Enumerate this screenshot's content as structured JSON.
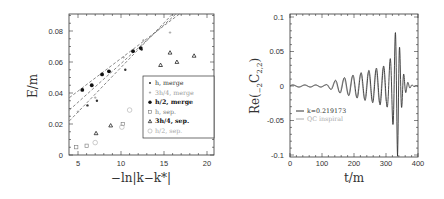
{
  "chart_data": [
    {
      "type": "scatter",
      "title": "",
      "xlabel": "-ln|k-k*|",
      "ylabel": "E/m",
      "xlim": [
        4,
        20.8
      ],
      "ylim": [
        0,
        0.091
      ],
      "xticks": [
        "5",
        "10",
        "15",
        "20"
      ],
      "yticks": [
        "0",
        "0.02",
        "0.04",
        "0.06",
        "0.08"
      ],
      "grid": false,
      "legend_position": "lower right (inside)",
      "series": [
        {
          "name": "h, merge",
          "marker": "small-dot",
          "color": "#333333",
          "points": [
            [
              6.1,
              0.032
            ],
            [
              7.2,
              0.035
            ],
            [
              10.5,
              0.055
            ],
            [
              12.4,
              0.068
            ]
          ]
        },
        {
          "name": "3h/4, merge",
          "marker": "small-plus",
          "color": "#999999",
          "points": [
            [
              5.0,
              0.028
            ],
            [
              7.0,
              0.037
            ],
            [
              10.3,
              0.063
            ],
            [
              12.6,
              0.074
            ],
            [
              15.7,
              0.079
            ]
          ]
        },
        {
          "name": "h/2, merge",
          "marker": "filled-circle",
          "color": "#111111",
          "points": [
            [
              5.5,
              0.042
            ],
            [
              6.6,
              0.045
            ],
            [
              7.8,
              0.052
            ],
            [
              8.6,
              0.054
            ],
            [
              11.4,
              0.067
            ],
            [
              12.3,
              0.069
            ]
          ]
        },
        {
          "name": "h, sep.",
          "marker": "open-square",
          "color": "#777777",
          "points": [
            [
              4.8,
              0.005
            ],
            [
              6.0,
              0.006
            ],
            [
              10.2,
              0.02
            ]
          ]
        },
        {
          "name": "3h/4, sep.",
          "marker": "open-triangle",
          "color": "#222222",
          "points": [
            [
              7.1,
              0.014
            ],
            [
              8.8,
              0.019
            ],
            [
              14.6,
              0.058
            ],
            [
              15.7,
              0.066
            ],
            [
              16.5,
              0.06
            ],
            [
              18.5,
              0.064
            ]
          ]
        },
        {
          "name": "h/2, sep.",
          "marker": "open-circle",
          "color": "#aaaaaa",
          "points": [
            [
              7.0,
              0.008
            ],
            [
              10.1,
              0.018
            ],
            [
              11.0,
              0.029
            ]
          ]
        }
      ],
      "fit_lines": [
        {
          "style": "dashed",
          "from": [
            4,
            0.037
          ],
          "to": [
            16.8,
            0.091
          ]
        },
        {
          "style": "dashed",
          "from": [
            4,
            0.029
          ],
          "to": [
            16.4,
            0.091
          ]
        },
        {
          "style": "dashed",
          "from": [
            4,
            0.022
          ],
          "to": [
            16.0,
            0.091
          ]
        }
      ]
    },
    {
      "type": "line",
      "title": "",
      "xlabel": "t/m",
      "ylabel": "Re(-2C2,2)",
      "xlim": [
        0,
        400
      ],
      "ylim": [
        -0.1,
        0.1
      ],
      "xticks": [
        "0",
        "100",
        "200",
        "300",
        "400"
      ],
      "yticks": [
        "0.1",
        "0.05",
        "0",
        "-0.05",
        "-0.1"
      ],
      "grid": false,
      "legend_position": "center left (inside)",
      "series": [
        {
          "name": "k=0.219173",
          "color": "#333333",
          "description": "oscillating waveform, small amplitude until t~120, growing from ~0.01 at t~160 to ~0.03 at t~300, merger burst peaking ~0.1 near t~335, ringdown to 0 by t~380"
        },
        {
          "name": "QC inspiral",
          "color": "#aaaaaa",
          "description": "gray reference inspiral curve overlapping the early part"
        }
      ]
    }
  ],
  "left_plot": {
    "ylabel": "E/m",
    "xlabel": "−ln|k−k*|",
    "yticks": [
      "0",
      "0.02",
      "0.04",
      "0.06",
      "0.08"
    ],
    "xticks": [
      "5",
      "10",
      "15",
      "20"
    ],
    "legend": [
      {
        "label": "h, merge",
        "color": "#333333",
        "bold": false
      },
      {
        "label": "3h/4, merge",
        "color": "#999999",
        "bold": false
      },
      {
        "label": "h/2, merge",
        "color": "#111111",
        "bold": true
      },
      {
        "label": "h, sep.",
        "color": "#777777",
        "bold": false
      },
      {
        "label": "3h/4, sep.",
        "color": "#111111",
        "bold": true
      },
      {
        "label": "h/2, sep.",
        "color": "#aaaaaa",
        "bold": false
      }
    ]
  },
  "right_plot": {
    "ylabel": "Re(",
    "ylabel_sub1": "−2",
    "ylabel_mid": "C",
    "ylabel_sub2": "2,2",
    "ylabel_end": ")",
    "xlabel": "t/m",
    "yticks": [
      "0.1",
      "0.05",
      "0",
      "-0.05",
      "-0.1"
    ],
    "xticks": [
      "0",
      "100",
      "200",
      "300",
      "400"
    ],
    "legend": [
      {
        "label": "k=0.219173",
        "color": "#333333"
      },
      {
        "label": "QC inspiral",
        "color": "#aaaaaa"
      }
    ]
  }
}
